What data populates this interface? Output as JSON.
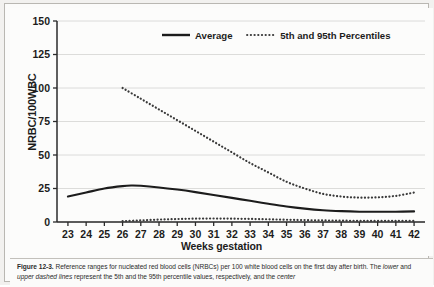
{
  "figure": {
    "caption_label": "Figure 12-3.",
    "caption_part1": " Reference ranges for nucleated red blood cells (NRBCs) per 100 white blood cells on the first day after birth. The ",
    "caption_em1": "lower",
    "caption_part2": " and ",
    "caption_em2": "upper dashed lines",
    "caption_part3": " represent the 5th and the 95th percentile values, respectively, and the ",
    "caption_em3": "center"
  },
  "chart_data": {
    "type": "line",
    "title": "",
    "xlabel": "Weeks gestation",
    "ylabel": "NRBC/100WBC",
    "xlim": [
      22.4,
      42.6
    ],
    "ylim": [
      0,
      150
    ],
    "yticks": [
      0,
      25,
      50,
      75,
      100,
      125,
      150
    ],
    "ytick_labels": [
      "0",
      "25",
      "50",
      "75",
      "100",
      "125",
      "150"
    ],
    "xticks": [
      23,
      24,
      25,
      26,
      27,
      28,
      29,
      30,
      31,
      32,
      33,
      34,
      35,
      36,
      37,
      38,
      39,
      40,
      41,
      42
    ],
    "xtick_labels": [
      "23",
      "24",
      "25",
      "26",
      "27",
      "28",
      "29",
      "30",
      "31",
      "32",
      "33",
      "34",
      "35",
      "36",
      "37",
      "38",
      "39",
      "40",
      "41",
      "42"
    ],
    "grid": true,
    "grid_axis": "y",
    "legend_position": "top-right",
    "legend": [
      {
        "label": "Average",
        "style": "solid",
        "color": "#1c1c1c"
      },
      {
        "label": "5th and 95th Percentiles",
        "style": "dotted",
        "color": "#3a3a3a"
      }
    ],
    "series": [
      {
        "name": "Average",
        "style": "solid",
        "color": "#1c1c1c",
        "x": [
          23,
          24,
          25,
          26,
          26.5,
          27,
          28,
          29,
          30,
          31,
          32,
          33,
          34,
          35,
          36,
          37,
          38,
          39,
          40,
          41,
          42
        ],
        "values": [
          19,
          22,
          25,
          26.8,
          27.2,
          27,
          25.8,
          24.2,
          22.3,
          20.2,
          18,
          15.8,
          13.6,
          11.6,
          10,
          8.8,
          8.1,
          7.7,
          7.6,
          7.7,
          7.9
        ]
      },
      {
        "name": "95th Percentile",
        "style": "dotted",
        "color": "#3a3a3a",
        "x": [
          26,
          27,
          28,
          29,
          30,
          31,
          32,
          33,
          34,
          35,
          36,
          37,
          38,
          39,
          40,
          41,
          42
        ],
        "values": [
          100,
          92,
          84,
          76,
          68,
          60,
          52,
          44,
          37,
          30,
          25,
          21,
          19,
          18.2,
          18.4,
          19.5,
          22
        ]
      },
      {
        "name": "5th Percentile",
        "style": "dotted",
        "color": "#3a3a3a",
        "x": [
          26,
          27,
          28,
          29,
          30,
          31,
          32,
          33,
          34,
          35,
          36,
          37,
          38,
          39,
          40,
          41,
          42
        ],
        "values": [
          0.6,
          1.2,
          1.8,
          2.2,
          2.5,
          2.6,
          2.5,
          2.3,
          2.0,
          1.7,
          1.4,
          1.2,
          1.0,
          0.9,
          0.8,
          0.8,
          0.8
        ]
      }
    ]
  }
}
